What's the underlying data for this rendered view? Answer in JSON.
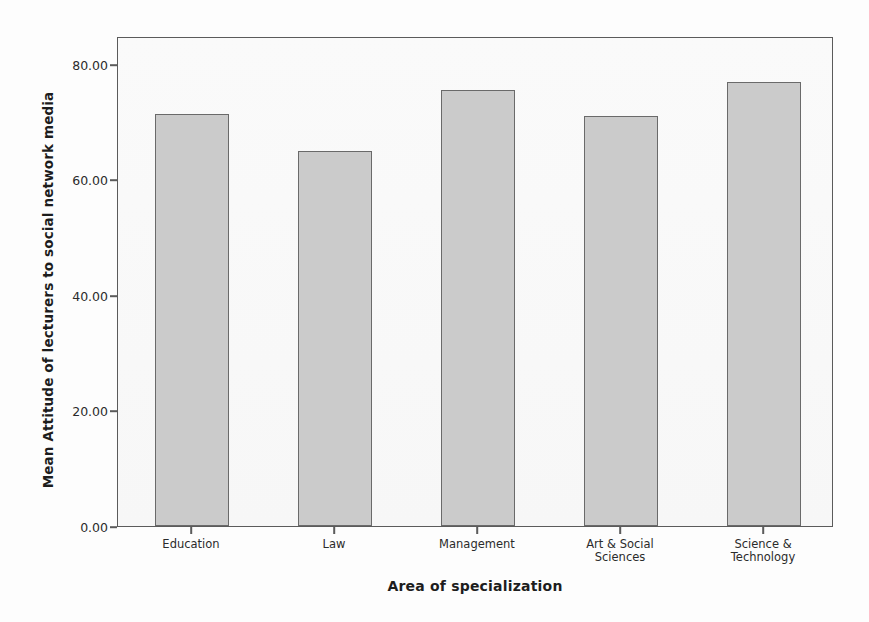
{
  "chart_data": {
    "type": "bar",
    "title": "",
    "categories": [
      "Education",
      "Law",
      "Management",
      "Art & Social Sciences",
      "Science & Technology"
    ],
    "values": [
      72.4,
      65.9,
      76.6,
      72.0,
      78.0
    ],
    "xlabel": "Area of specialization",
    "ylabel": "Mean Attitude of lecturers to social network media",
    "ylim": [
      0,
      86
    ],
    "yticks": [
      0,
      20,
      40,
      60,
      80
    ],
    "ytick_labels": [
      "0.00",
      "20.00",
      "40.00",
      "60.00",
      "80.00"
    ],
    "grid": false,
    "legend": "none",
    "bar_fill": "#cbcbcb",
    "bar_border": "#6a6a6a",
    "frame_color": "#5b5b5b",
    "plot_background": "#f8f8f8"
  },
  "axes": {
    "y_title": "Mean Attitude of lecturers to social network media",
    "x_title": "Area of specialization"
  },
  "scan_artifacts": {
    "bleed_lines": [
      "the e more than anything at these scanned words fad",
      "y more likely to use social network less than do less so",
      "and h2 which were stated to give this study above the",
      "could easily the the data we arrange to from their that and",
      "their students",
      "The respondents had that result the attitude of lecturers on the",
      "specialization had it on the part and of the use of social",
      "Hypothesis 1: There is no difference between lecturers of different areas",
      "in their attitude toward the use",
      "of social network media",
      "Table",
      "the to",
      "there"
    ]
  }
}
